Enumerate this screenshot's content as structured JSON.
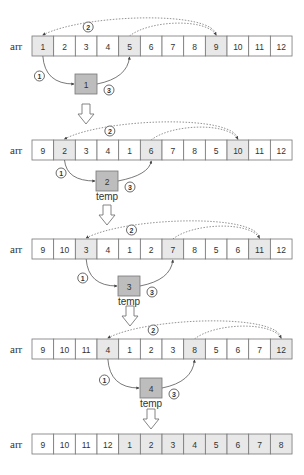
{
  "array_label": "arr",
  "temp_label": "temp",
  "colors": {
    "cell_fill": "#ffffff",
    "highlight_fill": "#e8e8e8",
    "temp_fill": "#bdbdbd",
    "border": "#777777",
    "arc": "#555555",
    "dotted_arc": "#777777"
  },
  "steps": [
    {
      "array": [
        1,
        2,
        3,
        4,
        5,
        6,
        7,
        8,
        9,
        10,
        11,
        12
      ],
      "highlighted": [
        0,
        4,
        8
      ],
      "temp_value": "1",
      "show_temp_label": false,
      "step_labels": [
        "1",
        "2",
        "3"
      ]
    },
    {
      "array": [
        9,
        2,
        3,
        4,
        1,
        6,
        7,
        8,
        5,
        10,
        11,
        12
      ],
      "highlighted": [
        1,
        5,
        9
      ],
      "temp_value": "2",
      "show_temp_label": true,
      "step_labels": [
        "1",
        "2",
        "3"
      ]
    },
    {
      "array": [
        9,
        10,
        3,
        4,
        1,
        2,
        7,
        8,
        5,
        6,
        11,
        12
      ],
      "highlighted": [
        2,
        6,
        10
      ],
      "temp_value": "3",
      "show_temp_label": true,
      "step_labels": [
        "1",
        "2",
        "3"
      ]
    },
    {
      "array": [
        9,
        10,
        11,
        4,
        1,
        2,
        3,
        8,
        5,
        6,
        7,
        12
      ],
      "highlighted": [
        3,
        7,
        11
      ],
      "temp_value": "4",
      "show_temp_label": true,
      "step_labels": [
        "1",
        "2",
        "3"
      ]
    }
  ],
  "final": {
    "array": [
      9,
      10,
      11,
      12,
      1,
      2,
      3,
      4,
      5,
      6,
      7,
      8
    ],
    "highlighted": [
      4,
      5,
      6,
      7,
      8,
      9,
      10,
      11
    ]
  }
}
